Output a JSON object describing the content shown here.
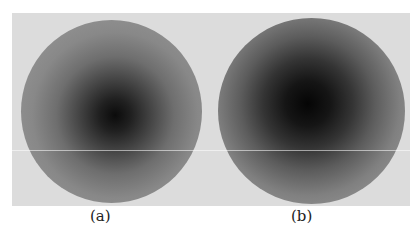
{
  "figure": {
    "panels": [
      {
        "id": "a",
        "caption": "(a)",
        "description": "circular disk with dark center fading to gray edge"
      },
      {
        "id": "b",
        "caption": "(b)",
        "description": "circular disk with larger dark center fading to gray edge"
      }
    ]
  }
}
